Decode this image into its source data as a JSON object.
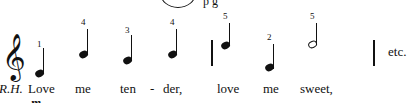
{
  "header_fragment": {
    "text": "p g"
  },
  "clef": {
    "symbol": "𝄞",
    "name": "treble-clef"
  },
  "hand_label": "R.H.",
  "notes": [
    {
      "finger": "1",
      "lyric": "Love",
      "type": "quarter"
    },
    {
      "finger": "4",
      "lyric": "me",
      "type": "quarter"
    },
    {
      "finger": "3",
      "lyric": "ten",
      "type": "quarter"
    },
    {
      "finger": "4",
      "lyric": "der,",
      "type": "quarter"
    },
    {
      "finger": "5",
      "lyric": "love",
      "type": "quarter"
    },
    {
      "finger": "2",
      "lyric": "me",
      "type": "quarter"
    },
    {
      "finger": "5",
      "lyric": "sweet,",
      "type": "half"
    }
  ],
  "hyphen": "-",
  "ending_text": "etc.",
  "dynamic_fragment": "m"
}
